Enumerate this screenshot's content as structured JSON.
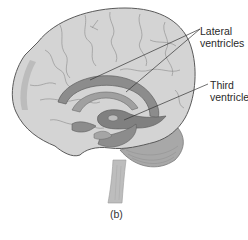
{
  "figure": {
    "caption": "(b)",
    "labels": [
      {
        "id": "lateral",
        "lines": [
          "Lateral",
          "ventricles"
        ],
        "pointers": 2
      },
      {
        "id": "third",
        "lines": [
          "Third",
          "ventricle"
        ],
        "pointers": 1
      }
    ],
    "colors": {
      "background": "#ffffff",
      "cortex_fill": "#d4d4d4",
      "cortex_outline": "#5a5a5a",
      "sulci": "#8a8a8a",
      "ventricle_fill": "#8c8c8c",
      "ventricle_dark": "#767676",
      "cerebellum": "#a8a8a8",
      "brainstem": "#bdbdbd",
      "leader_line": "#333333",
      "text": "#2a2a2a"
    }
  }
}
